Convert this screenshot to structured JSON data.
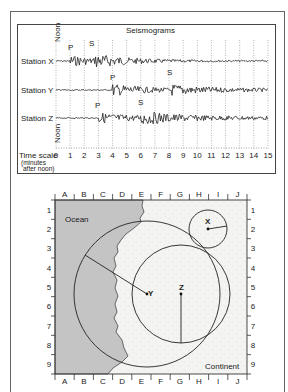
{
  "seismogram_panel": {
    "title": "Seismograms",
    "noon_top_label": "Noon",
    "noon_bottom_label": "Noon",
    "time_scale_label": "Time scale",
    "time_scale_sub1": "(minutes",
    "time_scale_sub2": "after noon)",
    "ticks": [
      "0",
      "1",
      "2",
      "3",
      "4",
      "5",
      "6",
      "7",
      "8",
      "9",
      "10",
      "11",
      "12",
      "13",
      "14",
      "15"
    ],
    "stations": [
      {
        "label": "Station X",
        "p_label": "P",
        "s_label": "S",
        "p_arrival_min": 1,
        "s_arrival_min": 2.8
      },
      {
        "label": "Station Y",
        "p_label": "P",
        "s_label": "S",
        "p_arrival_min": 4,
        "s_arrival_min": 8
      },
      {
        "label": "Station Z",
        "p_label": "P",
        "s_label": "S",
        "p_arrival_min": 3,
        "s_arrival_min": 6
      }
    ]
  },
  "map_panel": {
    "columns": [
      "A",
      "B",
      "C",
      "D",
      "E",
      "F",
      "G",
      "H",
      "I",
      "J"
    ],
    "rows": [
      "1",
      "2",
      "3",
      "4",
      "5",
      "6",
      "7",
      "8",
      "9"
    ],
    "ocean_label": "Ocean",
    "continent_label": "Continent",
    "stations": [
      {
        "label": "X",
        "grid": "H2"
      },
      {
        "label": "Y",
        "grid": "E5"
      },
      {
        "label": "Z",
        "grid": "G5"
      }
    ]
  },
  "colors": {
    "ocean": "#c4c4c4",
    "continent": "#f4f4f2",
    "line": "#222222"
  }
}
